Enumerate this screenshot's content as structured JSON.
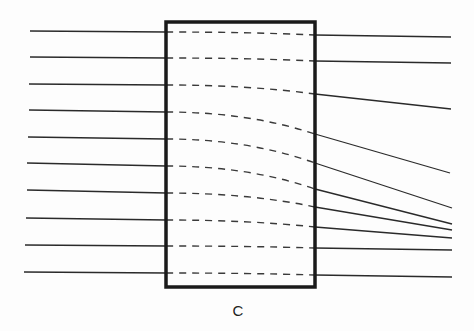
{
  "diagram": {
    "label": "C",
    "colors": {
      "stroke": "#2a2a2a",
      "box": "#1a1a1a",
      "dash": "#3a3a3a",
      "background": "#fdfdfd"
    },
    "box": {
      "x": 166,
      "y": 22,
      "width": 149,
      "height": 265
    },
    "rays": [
      {
        "in_start": [
          30,
          31
        ],
        "in_end": [
          166,
          32
        ],
        "inside_end": [
          315,
          35
        ],
        "out_end": [
          451,
          37
        ]
      },
      {
        "in_start": [
          30,
          57
        ],
        "in_end": [
          166,
          58
        ],
        "inside_end": [
          315,
          61
        ],
        "out_end": [
          451,
          63
        ]
      },
      {
        "in_start": [
          29,
          84
        ],
        "in_end": [
          166,
          85
        ],
        "inside_end": [
          315,
          94
        ],
        "out_end": [
          451,
          109
        ]
      },
      {
        "in_start": [
          29,
          110
        ],
        "in_end": [
          166,
          112
        ],
        "inside_end": [
          315,
          134
        ],
        "out_end": [
          450,
          173
        ]
      },
      {
        "in_start": [
          28,
          137
        ],
        "in_end": [
          166,
          139
        ],
        "inside_end": [
          315,
          163
        ],
        "out_end": [
          452,
          208
        ]
      },
      {
        "in_start": [
          27,
          163
        ],
        "in_end": [
          166,
          166
        ],
        "inside_end": [
          315,
          189
        ],
        "out_end": [
          452,
          224
        ]
      },
      {
        "in_start": [
          27,
          190
        ],
        "in_end": [
          166,
          193
        ],
        "inside_end": [
          315,
          207
        ],
        "out_end": [
          452,
          230
        ]
      },
      {
        "in_start": [
          26,
          218
        ],
        "in_end": [
          166,
          220
        ],
        "inside_end": [
          315,
          227
        ],
        "out_end": [
          452,
          238
        ]
      },
      {
        "in_start": [
          25,
          245
        ],
        "in_end": [
          166,
          246
        ],
        "inside_end": [
          315,
          248
        ],
        "out_end": [
          452,
          250
        ]
      },
      {
        "in_start": [
          24,
          272
        ],
        "in_end": [
          166,
          273
        ],
        "inside_end": [
          315,
          275
        ],
        "out_end": [
          452,
          277
        ]
      }
    ],
    "label_pos": [
      238,
      316
    ]
  }
}
